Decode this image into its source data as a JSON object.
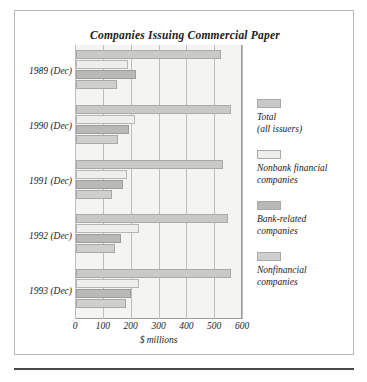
{
  "figure": {
    "title": "Companies Issuing Commercial Paper"
  },
  "chart_data": {
    "type": "bar",
    "orientation": "horizontal",
    "title": "Companies Issuing Commercial Paper",
    "xlabel": "$ millions",
    "ylabel": "",
    "xlim": [
      0,
      600
    ],
    "xticks": [
      0,
      100,
      200,
      300,
      400,
      500,
      600
    ],
    "xtick_labels": [
      "0",
      "100",
      "200",
      "300",
      "400",
      "500",
      "600"
    ],
    "grid": true,
    "grid_axis": "x",
    "legend_position": "right",
    "categories": [
      "1989 (Dec)",
      "1990 (Dec)",
      "1991 (Dec)",
      "1992 (Dec)",
      "1993 (Dec)"
    ],
    "series": [
      {
        "name": "Total (all issuers)",
        "name_line1": "Total",
        "name_line2": "(all issuers)",
        "color": "#c9c9c7",
        "values": [
          521,
          558,
          529,
          545,
          557
        ]
      },
      {
        "name": "Nonbank financial companies",
        "name_line1": "Nonbank financial",
        "name_line2": "companies",
        "color": "#eeeeec",
        "values": [
          188,
          212,
          182,
          226,
          227
        ]
      },
      {
        "name": "Bank-related companies",
        "name_line1": "Bank-related",
        "name_line2": "companies",
        "color": "#b9b9b7",
        "values": [
          216,
          190,
          168,
          160,
          198
        ]
      },
      {
        "name": "Nonfinancial companies",
        "name_line1": "Nonfinancial",
        "name_line2": "companies",
        "color": "#cfcfcd",
        "values": [
          148,
          150,
          128,
          140,
          180
        ]
      }
    ]
  }
}
